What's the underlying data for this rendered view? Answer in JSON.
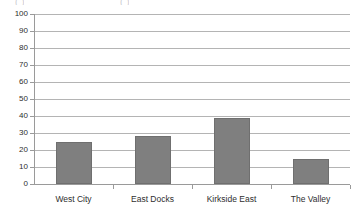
{
  "chart_data": {
    "type": "bar",
    "title": "",
    "subtitle": "",
    "xlabel": "",
    "ylabel": "",
    "categories": [
      "West City",
      "East Docks",
      "Kirkside East",
      "The Valley"
    ],
    "values": [
      25,
      28,
      39,
      15
    ],
    "series": [
      {
        "name": "",
        "values": [
          25,
          28,
          39,
          15
        ]
      }
    ],
    "ylim": [
      0,
      100
    ],
    "y_ticks": [
      0,
      10,
      20,
      30,
      40,
      50,
      60,
      70,
      80,
      90,
      100
    ],
    "y_tick_labels": [
      "0",
      "10",
      "20",
      "30",
      "40",
      "50",
      "60",
      "70",
      "80",
      "90",
      "100"
    ],
    "grid": true,
    "grid_axis": "y",
    "legend": false,
    "legend_position": "none",
    "bar_color": "#7f7f7f",
    "gridline_color": "#b4b4b4",
    "axis_color": "#9a9a9a",
    "text_color": "#2e2e2e",
    "background_color": "#ffffff",
    "annotations": []
  },
  "artifacts": {
    "top_cropped_marks": [
      "( )",
      "( )"
    ]
  }
}
